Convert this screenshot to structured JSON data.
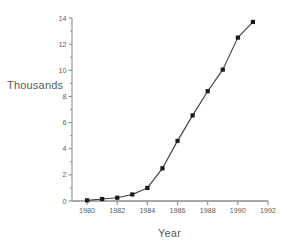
{
  "chart_data": {
    "type": "line",
    "title": "",
    "subtitle": "",
    "xlabel": "Year",
    "ylabel": "Thousands",
    "x": [
      1980,
      1981,
      1982,
      1983,
      1984,
      1985,
      1986,
      1987,
      1988,
      1989,
      1990,
      1991
    ],
    "values": [
      0.05,
      0.15,
      0.25,
      0.5,
      1.0,
      2.5,
      4.6,
      6.55,
      8.4,
      10.05,
      12.5,
      13.7
    ],
    "series": [
      {
        "name": "Thousands",
        "values": [
          0.05,
          0.15,
          0.25,
          0.5,
          1.0,
          2.5,
          4.6,
          6.55,
          8.4,
          10.05,
          12.5,
          13.7
        ]
      }
    ],
    "xlim": [
      1979,
      1992
    ],
    "ylim": [
      0,
      14
    ],
    "x_tick_labels": [
      "1980",
      "1982",
      "1984",
      "1986",
      "1988",
      "1990",
      "1992"
    ],
    "x_tick_values": [
      1980,
      1982,
      1984,
      1986,
      1988,
      1990,
      1992
    ],
    "x_minor_tick_values": [
      1981,
      1983,
      1985,
      1987,
      1989,
      1991
    ],
    "y_tick_labels": [
      "0",
      "2",
      "4",
      "6",
      "8",
      "10",
      "12",
      "14"
    ],
    "y_tick_values": [
      0,
      2,
      4,
      6,
      8,
      10,
      12,
      14
    ],
    "y_minor_tick_values": [
      1,
      3,
      5,
      7,
      9,
      11,
      13
    ],
    "grid": false,
    "legend": false,
    "marker": "square",
    "line_color": "#3a3a3a",
    "marker_color": "#1a1a1a",
    "axis_color": "#8c8c8c",
    "text_color": "#5a5a5a",
    "background_color": "#ffffff"
  },
  "labels": {
    "y_axis_title": "Thousands",
    "x_axis_title": "Year"
  }
}
